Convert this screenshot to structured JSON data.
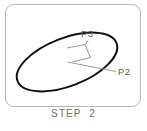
{
  "figure": {
    "caption": "STEP  2",
    "frame": {
      "border_color": "#b9b9b9",
      "background": "#ffffff",
      "corner_radius": 9
    },
    "labels": [
      {
        "id": "P3",
        "text": "P3",
        "x": 81,
        "y": 28
      },
      {
        "id": "P2",
        "text": "P2",
        "x": 118,
        "y": 66
      }
    ],
    "shapes": {
      "ellipse": {
        "name": "main-ellipse",
        "center_x": 67,
        "center_y": 62,
        "radius_x": 53,
        "radius_y": 24,
        "rotation_deg": -21,
        "stroke": "#111111",
        "stroke_width": 2,
        "fill": "none"
      },
      "right_angle_marker": {
        "name": "right-angle-marker",
        "points": "67,48 85,44 90,57 72,62",
        "stroke": "#9a9a9a",
        "stroke_width": 1,
        "fill": "none"
      },
      "radius_line": {
        "name": "radius-line-to-p2",
        "x1": 67,
        "y1": 62,
        "x2": 116,
        "y2": 71,
        "stroke": "#9a9a9a",
        "stroke_width": 1
      },
      "chord_line": {
        "name": "chord-line-to-p3",
        "x1": 85,
        "y1": 44,
        "x2": 88,
        "y2": 41,
        "stroke": "#9a9a9a",
        "stroke_width": 1
      }
    }
  }
}
